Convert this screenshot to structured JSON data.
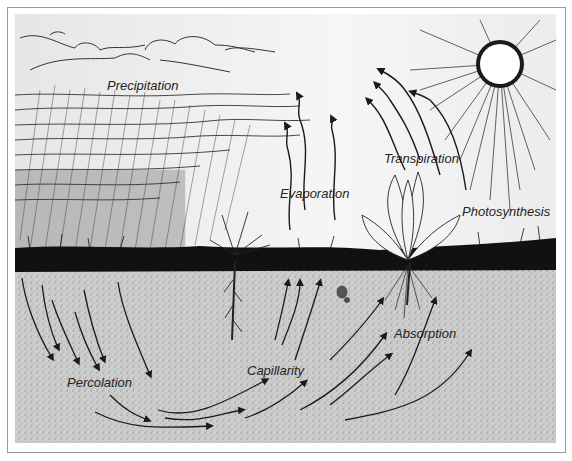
{
  "diagram": {
    "type": "water-cycle-illustration",
    "labels": {
      "precipitation": "Precipitation",
      "evaporation": "Evaporation",
      "transpiration": "Transpiration",
      "photosynthesis": "Photosynthesis",
      "percolation": "Percolation",
      "capillarity": "Capillarity",
      "absorption": "Absorption"
    },
    "colors": {
      "sky": "#efefef",
      "soil": "#c9c9c9",
      "ink": "#1a1a1a",
      "sun": "#ffffff"
    }
  }
}
